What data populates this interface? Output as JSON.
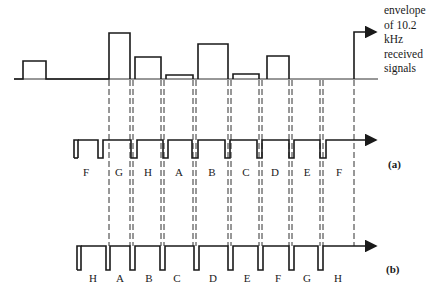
{
  "envelope_label": [
    "envelope",
    "of 10.2",
    "kHz",
    "received",
    "signals"
  ],
  "row_a": {
    "caption": "(a)",
    "segment_labels": [
      "F",
      "G",
      "H",
      "A",
      "B",
      "C",
      "D",
      "E",
      "F"
    ],
    "label_x": [
      86,
      118,
      148,
      178,
      212,
      246,
      274,
      304,
      335
    ]
  },
  "row_b": {
    "caption": "(b)",
    "segment_labels": [
      "H",
      "A",
      "B",
      "C",
      "D",
      "E",
      "F",
      "G",
      "H"
    ],
    "label_x": [
      93,
      120,
      149,
      177,
      213,
      245,
      276,
      305,
      336
    ]
  },
  "envelope_segments": [
    {
      "label": "pre",
      "x0": 23,
      "x1": 46,
      "top": 61
    },
    {
      "label": "G",
      "x0": 109,
      "x1": 130,
      "top": 33
    },
    {
      "label": "H",
      "x0": 135,
      "x1": 161,
      "top": 57
    },
    {
      "label": "A",
      "x0": 166,
      "x1": 193,
      "top": 75
    },
    {
      "label": "B",
      "x0": 198,
      "x1": 228,
      "top": 44
    },
    {
      "label": "C",
      "x0": 233,
      "x1": 259,
      "top": 74
    },
    {
      "label": "D",
      "x0": 267,
      "x1": 289,
      "top": 56
    },
    {
      "label": "H-next",
      "x0": 354,
      "x1": 378,
      "top": 32
    }
  ],
  "colors": {
    "ink": "#1a1a1a",
    "background": "#ffffff"
  }
}
